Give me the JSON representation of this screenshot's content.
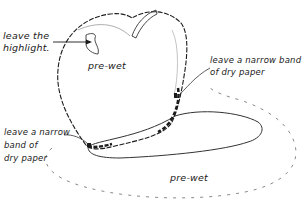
{
  "diagram": {
    "colors": {
      "ink": "#1a1a1a",
      "faint": "#8a8a8a",
      "background": "#ffffff"
    },
    "annotations": {
      "highlight": {
        "line1": "leave the",
        "line2": "highlight."
      },
      "prewet_apple": "pre-wet",
      "right_band": {
        "line1": "leave a narrow band",
        "line2": "of dry paper"
      },
      "left_band": {
        "line1": "leave a narrow",
        "line2": "band of",
        "line3": "dry paper"
      },
      "prewet_surface": "pre-wet"
    }
  }
}
